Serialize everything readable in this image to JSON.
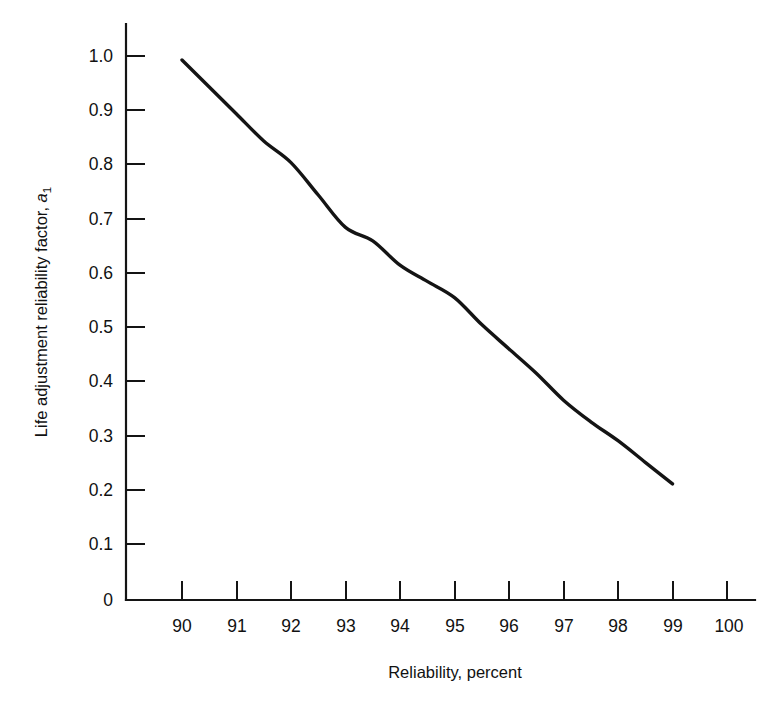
{
  "figure": {
    "background_color": "#ffffff",
    "ink_color": "#141414"
  },
  "axes": {
    "x": {
      "title": "Reliability, percent",
      "ticks": [
        "90",
        "91",
        "92",
        "93",
        "94",
        "95",
        "96",
        "97",
        "98",
        "99",
        "100"
      ],
      "range": [
        90,
        100
      ]
    },
    "y": {
      "title_main": "Life adjustment reliability factor, ",
      "title_symbol": "a",
      "title_subscript": "1",
      "ticks": [
        "1.0",
        "0.9",
        "0.8",
        "0.7",
        "0.6",
        "0.5",
        "0.4",
        "0.3",
        "0.2",
        "0.1",
        "0"
      ],
      "range": [
        0,
        1.0
      ]
    }
  },
  "chart_data": {
    "type": "line",
    "title": "",
    "xlabel": "Reliability, percent",
    "ylabel": "Life adjustment reliability factor, a1",
    "xlim": [
      90,
      100
    ],
    "ylim": [
      0,
      1.0
    ],
    "grid": false,
    "legend": null,
    "xticks": [
      90,
      91,
      92,
      93,
      94,
      95,
      96,
      97,
      98,
      99,
      100
    ],
    "yticks": [
      0,
      0.1,
      0.2,
      0.3,
      0.4,
      0.5,
      0.6,
      0.7,
      0.8,
      0.9,
      1.0
    ],
    "series": [
      {
        "name": "Life adjustment reliability factor",
        "x": [
          90,
          90.5,
          91,
          91.5,
          92,
          92.5,
          93,
          93.5,
          94,
          94.5,
          95,
          95.5,
          96,
          96.5,
          97,
          97.5,
          98,
          98.5,
          99
        ],
        "y": [
          1.0,
          0.95,
          0.9,
          0.85,
          0.81,
          0.75,
          0.69,
          0.665,
          0.62,
          0.59,
          0.56,
          0.51,
          0.465,
          0.42,
          0.37,
          0.33,
          0.295,
          0.255,
          0.215
        ]
      }
    ]
  }
}
